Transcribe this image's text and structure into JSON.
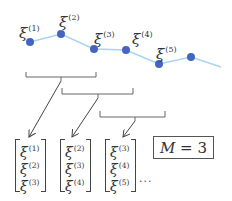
{
  "series": {
    "symbol": "ξ",
    "line_color": "#a7d4ee",
    "point_color": "#4466c2",
    "points": [
      {
        "index": "1",
        "x": 30,
        "y": 42,
        "label": "(1)"
      },
      {
        "index": "2",
        "x": 61,
        "y": 34,
        "label": "(2)"
      },
      {
        "index": "3",
        "x": 94,
        "y": 49,
        "label": "(3)"
      },
      {
        "index": "4",
        "x": 126,
        "y": 50,
        "label": "(4)"
      },
      {
        "index": "5",
        "x": 159,
        "y": 64,
        "label": "(5)"
      },
      {
        "index": "6",
        "x": 191,
        "y": 57,
        "label": ""
      }
    ]
  },
  "windows": [
    {
      "label": "window-1",
      "entries": [
        "(1)",
        "(2)",
        "(3)"
      ]
    },
    {
      "label": "window-2",
      "entries": [
        "(2)",
        "(3)",
        "(4)"
      ]
    },
    {
      "label": "window-3",
      "entries": [
        "(3)",
        "(4)",
        "(5)"
      ]
    }
  ],
  "ellipsis": "...",
  "param_box": {
    "var": "M",
    "op": " = ",
    "value": "3"
  }
}
